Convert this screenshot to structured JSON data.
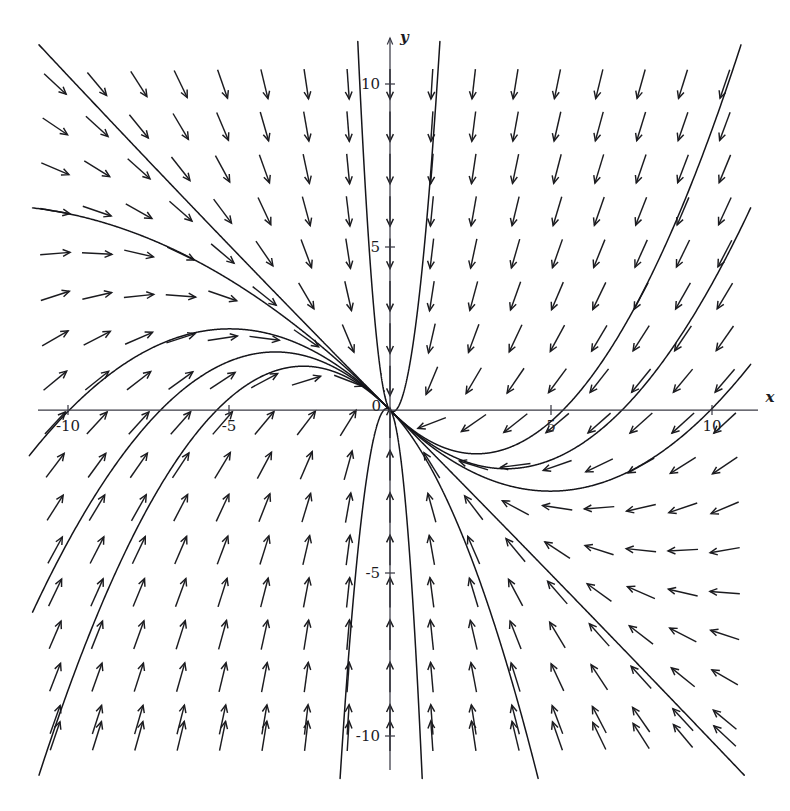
{
  "figure": {
    "kind": "direction-field",
    "background_color": "#ffffff",
    "arrow_color": "#1b1b1f",
    "axis_color": "#3a3a45",
    "curve_color": "#15151a"
  },
  "axes": {
    "x_axis_label": "x",
    "y_axis_label": "y",
    "origin_label": "0",
    "x_ticks": [
      {
        "value": -10,
        "label": "-10"
      },
      {
        "value": -5,
        "label": "-5"
      },
      {
        "value": 5,
        "label": "5"
      },
      {
        "value": 10,
        "label": "10"
      }
    ],
    "y_ticks": [
      {
        "value": 10,
        "label": "10"
      },
      {
        "value": 5,
        "label": "5"
      },
      {
        "value": -5,
        "label": "-5"
      },
      {
        "value": -10,
        "label": "-10"
      }
    ]
  },
  "chart_data": {
    "type": "scatter",
    "title": "",
    "xlabel": "x",
    "ylabel": "y",
    "xlim": [
      -11.2,
      11.3
    ],
    "ylim": [
      -11.4,
      11.4
    ],
    "grid": false,
    "legend": null,
    "field": {
      "description": "vector direction field with uniform-length arrows",
      "x_samples": [
        -10.4,
        -9.1,
        -7.8,
        -6.5,
        -5.2,
        -3.9,
        -2.6,
        -1.3,
        0.0,
        1.3,
        2.6,
        3.9,
        5.2,
        6.5,
        7.8,
        9.1,
        10.4
      ],
      "y_samples": [
        10.0,
        8.7,
        7.4,
        6.1,
        4.8,
        3.5,
        2.2,
        0.9,
        -0.4,
        -1.7,
        -3.0,
        -4.3,
        -5.6,
        -6.9,
        -8.2,
        -9.5,
        -10.0
      ],
      "u_expression": "-x",
      "v_expression": "-2*y - x",
      "arrow_length_px": 30
    },
    "trajectories": [
      {
        "name": "curve-1",
        "x0": -10.9,
        "y0": 11.2
      },
      {
        "name": "curve-2",
        "x0": -11.1,
        "y0": 6.2
      },
      {
        "name": "curve-3",
        "x0": -1.0,
        "y0": 11.3
      },
      {
        "name": "curve-4",
        "x0": 1.55,
        "y0": 11.3
      },
      {
        "name": "curve-5",
        "x0": 10.9,
        "y0": 11.2
      },
      {
        "name": "curve-6",
        "x0": 11.2,
        "y0": 6.2
      },
      {
        "name": "curve-7",
        "x0": 11.2,
        "y0": 1.4
      },
      {
        "name": "curve-8",
        "x0": -11.2,
        "y0": -1.4
      },
      {
        "name": "curve-9",
        "x0": -11.1,
        "y0": -6.2
      },
      {
        "name": "curve-10",
        "x0": -10.9,
        "y0": -11.2
      },
      {
        "name": "curve-11",
        "x0": -1.55,
        "y0": -11.3
      },
      {
        "name": "curve-12",
        "x0": 1.0,
        "y0": -11.3
      },
      {
        "name": "curve-13",
        "x0": 11.0,
        "y0": -11.2
      },
      {
        "name": "curve-14",
        "x0": 4.6,
        "y0": -11.3
      }
    ]
  },
  "geometry": {
    "origin_px": {
      "x": 390,
      "y": 410
    },
    "pixels_per_unit": {
      "x": 32.2,
      "y": 32.6
    },
    "x_axis_extent_px": {
      "left": 38,
      "right": 758
    },
    "y_axis_extent_px": {
      "top": 38,
      "bottom": 770
    }
  }
}
